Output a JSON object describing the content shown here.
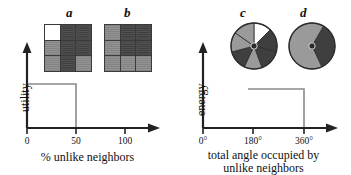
{
  "figure": {
    "background_color": "#ffffff",
    "ink_color": "#111111",
    "colors": {
      "white_cell": "#ffffff",
      "gray_cell": "#8e8e8e",
      "dark_cell": "#4a4a4a",
      "grid_line": "#3a3a3a",
      "curve": "#888888",
      "axis": "#222222"
    }
  },
  "panels": {
    "left": {
      "letters": [
        {
          "id": "a",
          "label": "a"
        },
        {
          "id": "b",
          "label": "b"
        }
      ],
      "grids": [
        {
          "id": "a",
          "rows": 3,
          "cols": 3,
          "cells": [
            "white",
            "dark",
            "dark",
            "gray",
            "dark",
            "dark",
            "gray",
            "dark",
            "gray"
          ]
        },
        {
          "id": "b",
          "rows": 3,
          "cols": 3,
          "cells": [
            "gray",
            "dark",
            "dark",
            "gray",
            "dark",
            "dark",
            "gray",
            "gray",
            "gray"
          ]
        }
      ],
      "ylabel": "utility",
      "xlabel": "% unlike neighbors",
      "xticks": [
        "0",
        "50",
        "100"
      ]
    },
    "right": {
      "letters": [
        {
          "id": "c",
          "label": "c"
        },
        {
          "id": "d",
          "label": "d"
        }
      ],
      "pies": [
        {
          "id": "c",
          "wedges": [
            {
              "start": 270,
              "sweep": 45,
              "fill": "white"
            },
            {
              "start": 315,
              "sweep": 60,
              "fill": "dark"
            },
            {
              "start": 15,
              "sweep": 55,
              "fill": "dark"
            },
            {
              "start": 70,
              "sweep": 45,
              "fill": "gray"
            },
            {
              "start": 115,
              "sweep": 50,
              "fill": "dark"
            },
            {
              "start": 165,
              "sweep": 50,
              "fill": "gray"
            },
            {
              "start": 215,
              "sweep": 55,
              "fill": "gray"
            }
          ]
        },
        {
          "id": "d",
          "wedges": [
            {
              "start": 300,
              "sweep": 125,
              "fill": "dark"
            },
            {
              "start": 65,
              "sweep": 235,
              "fill": "gray"
            }
          ]
        }
      ],
      "ylabel": "energy",
      "xlabel_line1": "total angle occupied by",
      "xlabel_line2": "unlike neighbors",
      "xticks": [
        "0°",
        "180°",
        "360°"
      ]
    }
  },
  "chart_data": [
    {
      "type": "line",
      "id": "utility-step-plot",
      "title": "",
      "xlabel": "% unlike neighbors",
      "ylabel": "utility",
      "xlim": [
        0,
        125
      ],
      "ylim": [
        0,
        1.25
      ],
      "xticks": [
        0,
        50,
        100
      ],
      "xticklabels": [
        "0",
        "50",
        "100"
      ],
      "yticks": [],
      "grid": false,
      "legend": false,
      "series": [
        {
          "name": "utility",
          "step": "post",
          "x": [
            0,
            50,
            50,
            125
          ],
          "y": [
            1,
            1,
            0,
            0
          ],
          "description": "Utility is high (1) for 0-50% unlike neighbors, then drops to 0 above 50%."
        }
      ]
    },
    {
      "type": "line",
      "id": "energy-step-plot",
      "title": "",
      "xlabel": "total angle occupied by unlike neighbors",
      "ylabel": "energy",
      "xlim": [
        0,
        420
      ],
      "ylim": [
        0,
        1.25
      ],
      "xticks": [
        0,
        180,
        360
      ],
      "xticklabels": [
        "0°",
        "180°",
        "360°"
      ],
      "yticks": [],
      "grid": false,
      "legend": false,
      "series": [
        {
          "name": "energy",
          "step": "post",
          "x": [
            0,
            170,
            170,
            360,
            360,
            420
          ],
          "y": [
            0,
            0,
            1,
            1,
            0,
            0
          ],
          "description": "Energy is 0 below ~180 degrees, steps up to a constant high level between ~180 and 360 degrees."
        }
      ]
    }
  ]
}
